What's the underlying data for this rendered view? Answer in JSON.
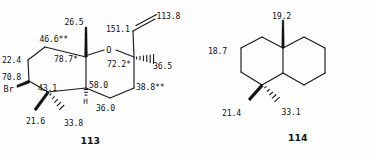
{
  "figure": {
    "kind": "chemical-structure-diagram",
    "background_color": "#fefefe",
    "line_color": "#1a1a1a"
  },
  "structures": [
    {
      "id": "structure-113",
      "compound_label": "113",
      "skeleton": "bromo octahydrochromene (bicyclic pyran-fused cyclohexane) with vinyl, gem-dimethyl and angular methyl",
      "heteroatom_labels": [
        {
          "name": "oxygen",
          "text": "O"
        },
        {
          "name": "bromine",
          "text": "Br"
        },
        {
          "name": "ring-fusion-hydrogen",
          "text": "H"
        }
      ],
      "shifts": [
        {
          "name": "shift-methyl-angular",
          "value": "26.5"
        },
        {
          "name": "shift-ch2-upper-left",
          "value": "46.6**"
        },
        {
          "name": "shift-quaternary-c8a",
          "value": "78.7*"
        },
        {
          "name": "shift-ch2-left",
          "value": "22.4"
        },
        {
          "name": "shift-chbr",
          "value": "70.8"
        },
        {
          "name": "shift-quaternary-gem-dimethyl",
          "value": "43.1"
        },
        {
          "name": "shift-methyl-gem-alpha",
          "value": "21.6"
        },
        {
          "name": "shift-methyl-gem-beta",
          "value": "33.8"
        },
        {
          "name": "shift-ring-fusion-ch",
          "value": "58.0"
        },
        {
          "name": "shift-ch2-lower-right",
          "value": "36.0"
        },
        {
          "name": "shift-ch2-right",
          "value": "38.8**"
        },
        {
          "name": "shift-oxygenated-ch",
          "value": "72.2*"
        },
        {
          "name": "shift-methyl-right",
          "value": "36.5"
        },
        {
          "name": "shift-vinyl-ch",
          "value": "151.1"
        },
        {
          "name": "shift-vinyl-ch2",
          "value": "113.8"
        }
      ]
    },
    {
      "id": "structure-114",
      "compound_label": "114",
      "skeleton": "decahydronaphthalene (decalin) with angular methyl and gem-dimethyl",
      "heteroatom_labels": [],
      "shifts": [
        {
          "name": "shift-methyl-angular",
          "value": "19.2"
        },
        {
          "name": "shift-ch2-left",
          "value": "18.7"
        },
        {
          "name": "shift-methyl-gem-alpha",
          "value": "21.4"
        },
        {
          "name": "shift-methyl-gem-beta",
          "value": "33.1"
        }
      ]
    }
  ],
  "footnotes": {
    "single_asterisk": "*",
    "double_asterisk": "**"
  }
}
